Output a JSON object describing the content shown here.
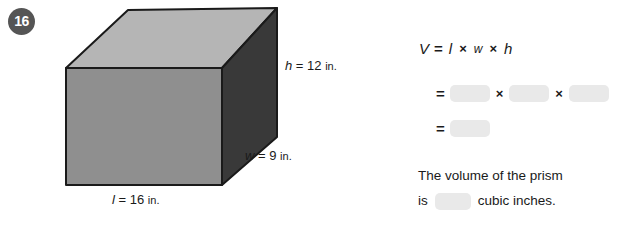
{
  "problem": {
    "number": "16"
  },
  "figure": {
    "shape_name": "rectangular-prism",
    "labels": {
      "height": {
        "var": "h",
        "eq": "=",
        "value": "12",
        "unit": "in."
      },
      "width": {
        "var": "w",
        "eq": "=",
        "value": "9",
        "unit": "in."
      },
      "length": {
        "var": "l",
        "eq": "=",
        "value": "16",
        "unit": "in."
      }
    },
    "colors": {
      "top_face": "#b5b5b5",
      "front_face": "#8f8f8f",
      "right_face": "#393939",
      "outline": "#1a1a1a"
    }
  },
  "work": {
    "formula": {
      "result_var": "V",
      "equals": "=",
      "length_var": "l",
      "times": "×",
      "width_var": "w",
      "height_var": "h"
    },
    "substitution_row": {
      "equals": "=",
      "times_1": "×",
      "times_2": "×"
    },
    "product_row": {
      "equals": "="
    },
    "blank_fill_color": "#e9e9e9"
  },
  "sentence": {
    "line1": "The volume of the prism",
    "line2_prefix": "is",
    "line2_suffix": "cubic inches."
  }
}
